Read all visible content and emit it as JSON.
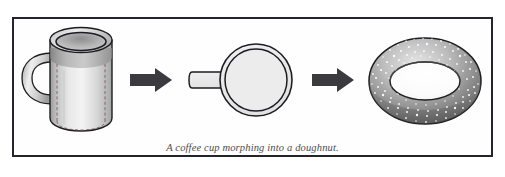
{
  "figure": {
    "caption": "A coffee cup morphing into a doughnut.",
    "background_color": "#ffffff",
    "frame_color": "#24242a",
    "inner_background": "#fefefe"
  },
  "stages": [
    {
      "id": "coffee-cup",
      "label": "coffee cup",
      "description": "Shaded cylindrical mug with elliptical rim, dashed hidden outline and a C-shaped handle on the left",
      "fill_light": "#f2f2f2",
      "fill_mid": "#c9c9c9",
      "fill_dark": "#9a9a9a",
      "outline_color": "#1d1d22"
    },
    {
      "id": "intermediate-disc",
      "label": "intermediate disc",
      "description": "Flat disc with concentric rim outline and a short handle stub extending to the left",
      "fill_light": "#ededed",
      "fill_mid": "#e4e4e4",
      "outline_color": "#1d1d22"
    },
    {
      "id": "doughnut",
      "label": "doughnut",
      "description": "Shaded torus with speckled sprinkle texture on the upper surface",
      "fill_light": "#d8d8d8",
      "fill_mid": "#9f9f9f",
      "fill_dark": "#5e5e5e",
      "outline_color": "#1d1d22"
    }
  ],
  "arrows": [
    {
      "id": "arrow-1",
      "label": "morph arrow one",
      "direction": "right",
      "color": "#3a3a3f"
    },
    {
      "id": "arrow-2",
      "label": "morph arrow two",
      "direction": "right",
      "color": "#3a3a3f"
    }
  ]
}
